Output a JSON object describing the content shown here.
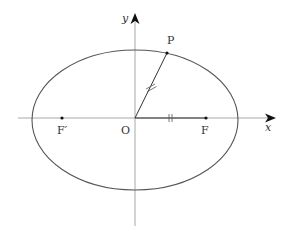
{
  "diagram": {
    "type": "ellipse-with-foci",
    "axes": {
      "x_label": "x",
      "y_label": "y",
      "origin_label": "O"
    },
    "points": {
      "P": "P",
      "F": "F",
      "F_prime": "F′"
    },
    "annotations": {
      "segment_OP": "equal-length tick marks (//)",
      "segment_OF": "equal-length tick marks (//)"
    },
    "colors": {
      "curve": "#555555",
      "axis": "#999999",
      "segment": "#333333"
    }
  }
}
